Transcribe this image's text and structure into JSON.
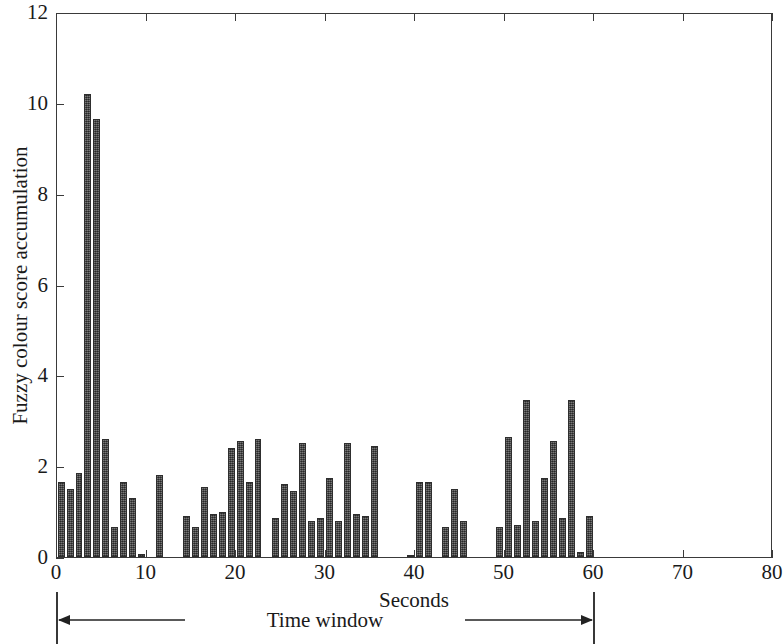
{
  "chart_data": {
    "type": "bar",
    "title": "",
    "subtitle": "",
    "xlabel": "Seconds",
    "ylabel": "Fuzzy colour score accumulation",
    "xlim": [
      0,
      80
    ],
    "ylim": [
      0,
      12
    ],
    "xticks": [
      0,
      10,
      20,
      30,
      40,
      50,
      60,
      70,
      80
    ],
    "yticks": [
      0,
      2,
      4,
      6,
      8,
      10,
      12
    ],
    "xtick_labels": [
      "0",
      "10",
      "20",
      "30",
      "40",
      "50",
      "60",
      "70",
      "80"
    ],
    "ytick_labels": [
      "0",
      "2",
      "4",
      "6",
      "8",
      "10",
      "12"
    ],
    "grid": false,
    "legend": null,
    "bar_width_seconds": 0.78,
    "bar_color": "#4d4d4d",
    "bar_edge_color": "#2e2e2e",
    "annotations": [
      {
        "text": "Time window",
        "type": "double-arrow-span",
        "x_start": 0,
        "x_end": 60
      }
    ],
    "x": [
      0,
      1,
      2,
      3,
      4,
      5,
      6,
      7,
      8,
      9,
      10,
      11,
      12,
      13,
      14,
      15,
      16,
      17,
      18,
      19,
      20,
      21,
      22,
      23,
      24,
      25,
      26,
      27,
      28,
      29,
      30,
      31,
      32,
      33,
      34,
      35,
      36,
      37,
      38,
      39,
      40,
      41,
      42,
      43,
      44,
      45,
      46,
      47,
      48,
      49,
      50,
      51,
      52,
      53,
      54,
      55,
      56,
      57,
      58,
      59
    ],
    "values": [
      1.65,
      1.5,
      1.85,
      10.2,
      9.65,
      2.6,
      0.65,
      1.65,
      1.3,
      0.07,
      0,
      1.8,
      0,
      0,
      0.9,
      0.65,
      1.55,
      0.95,
      1.0,
      2.4,
      2.55,
      1.65,
      2.6,
      0,
      0.85,
      1.6,
      1.45,
      2.5,
      0.8,
      0.85,
      1.75,
      0.8,
      2.5,
      0.95,
      0.9,
      2.45,
      0,
      0,
      0,
      0.05,
      1.65,
      1.65,
      0,
      0.65,
      1.5,
      0.8,
      0,
      0,
      0,
      0.65,
      2.65,
      0.7,
      3.45,
      0.8,
      1.75,
      2.55,
      0.85,
      3.45,
      0.1,
      0.9
    ]
  },
  "axis": {
    "ylabel": "Fuzzy colour score accumulation",
    "xlabel": "Seconds"
  },
  "annotation": {
    "time_window_label": "Time window"
  }
}
